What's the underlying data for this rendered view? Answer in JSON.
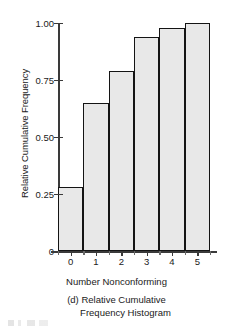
{
  "chart_data": {
    "type": "bar",
    "title": "",
    "categories": [
      "0",
      "1",
      "2",
      "3",
      "4",
      "5"
    ],
    "values": [
      0.28,
      0.65,
      0.79,
      0.94,
      0.98,
      1.0
    ],
    "series": [
      {
        "name": "Relative Cumulative Frequency",
        "values": [
          0.28,
          0.65,
          0.79,
          0.94,
          0.98,
          1.0
        ]
      }
    ],
    "xlabel": "Number Nonconforming",
    "ylabel": "Relative Cumulative Frequency",
    "ylim": [
      0,
      1.0
    ],
    "xlim": [
      -0.5,
      5.5
    ],
    "ytick_labels": [
      "0",
      "0.25",
      "0.50",
      "0.75",
      "1.00"
    ],
    "ytick_values": [
      0,
      0.25,
      0.5,
      0.75,
      1.0
    ],
    "xtick_labels": [
      "0",
      "1",
      "2",
      "3",
      "4",
      "5"
    ],
    "grid": false,
    "legend": false,
    "bar_fill_color": "#e8e8e8",
    "bar_edge_color": "#141414",
    "axis_color": "#3a3a3a",
    "background_color": "#ffffff"
  },
  "caption": {
    "line1": "(d) Relative Cumulative",
    "line2": "Frequency Histogram"
  }
}
